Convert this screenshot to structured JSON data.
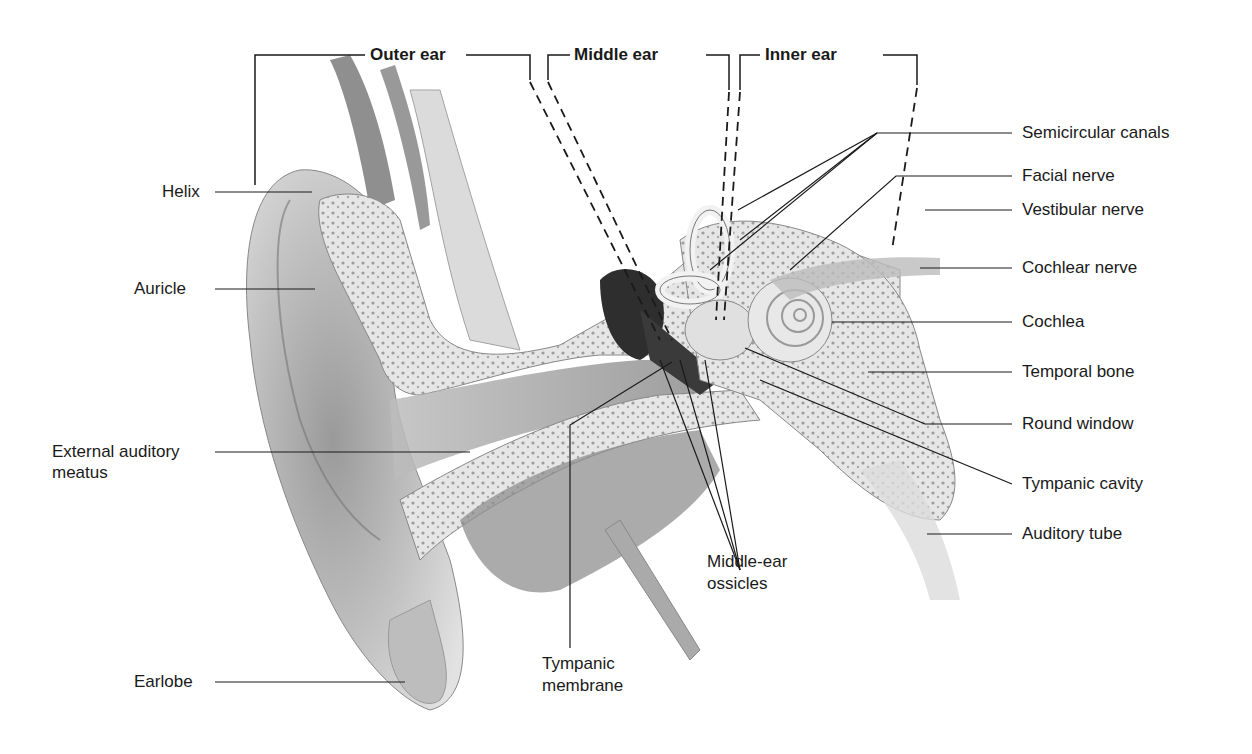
{
  "figure": {
    "regions": [
      {
        "id": "outer",
        "label": "Outer ear"
      },
      {
        "id": "middle",
        "label": "Middle ear"
      },
      {
        "id": "inner",
        "label": "Inner ear"
      }
    ],
    "left_labels": [
      {
        "id": "helix",
        "label": "Helix"
      },
      {
        "id": "auricle",
        "label": "Auricle"
      },
      {
        "id": "eam1",
        "label": "External auditory"
      },
      {
        "id": "eam2",
        "label": "meatus"
      },
      {
        "id": "earlobe",
        "label": "Earlobe"
      }
    ],
    "right_labels": [
      {
        "id": "semicircular",
        "label": "Semicircular canals"
      },
      {
        "id": "facial",
        "label": "Facial nerve"
      },
      {
        "id": "vestibular",
        "label": "Vestibular nerve"
      },
      {
        "id": "cochlear_nerve",
        "label": "Cochlear nerve"
      },
      {
        "id": "cochlea",
        "label": "Cochlea"
      },
      {
        "id": "temporal",
        "label": "Temporal bone"
      },
      {
        "id": "round",
        "label": "Round window"
      },
      {
        "id": "tympanic_cavity",
        "label": "Tympanic cavity"
      },
      {
        "id": "auditory_tube",
        "label": "Auditory tube"
      }
    ],
    "bottom_labels": [
      {
        "id": "ossicles1",
        "label": "Middle-ear"
      },
      {
        "id": "ossicles2",
        "label": "ossicles"
      },
      {
        "id": "tm1",
        "label": "Tympanic"
      },
      {
        "id": "tm2",
        "label": "membrane"
      }
    ]
  }
}
